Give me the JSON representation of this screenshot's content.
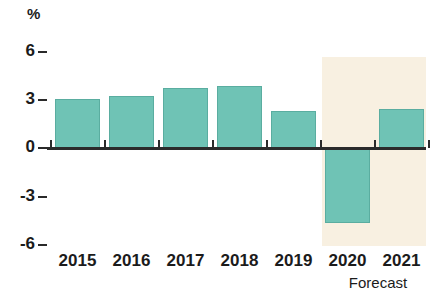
{
  "chart_data": {
    "type": "bar",
    "title": "",
    "subtitle": "",
    "xlabel": "",
    "ylabel": "%",
    "unit_label": "%",
    "categories": [
      "2015",
      "2016",
      "2017",
      "2018",
      "2019",
      "2020",
      "2021"
    ],
    "values": [
      3.0,
      3.2,
      3.7,
      3.8,
      2.3,
      -4.6,
      2.4
    ],
    "series": [
      {
        "name": "GDP growth",
        "values": [
          3.0,
          3.2,
          3.7,
          3.8,
          2.3,
          -4.6,
          2.4
        ]
      }
    ],
    "ylim": [
      -7.2,
      6.8
    ],
    "yticks": [
      6,
      3,
      0,
      -3,
      -6
    ],
    "ytick_labels": [
      "6",
      "3",
      "0",
      "-3",
      "-6"
    ],
    "grid": false,
    "legend": "none",
    "bar_color": "#6fc3b5",
    "bar_border_color": "#5aada0",
    "axis_color": "#2b2b2b",
    "forecast": {
      "label": "Forecast",
      "categories": [
        "2020",
        "2021"
      ],
      "band_color": "#f8f0e1"
    },
    "annotations": [
      {
        "text": "Forecast",
        "position": "below-axis-right"
      }
    ]
  },
  "axis": {
    "unit": "%",
    "ticks": [
      {
        "label": "6",
        "value": 6
      },
      {
        "label": "3",
        "value": 3
      },
      {
        "label": "0",
        "value": 0
      },
      {
        "label": "-3",
        "value": -3
      },
      {
        "label": "-6",
        "value": -6
      }
    ]
  },
  "xaxis": {
    "labels": [
      "2015",
      "2016",
      "2017",
      "2018",
      "2019",
      "2020",
      "2021"
    ]
  },
  "footer": {
    "forecast_note": "Forecast"
  }
}
